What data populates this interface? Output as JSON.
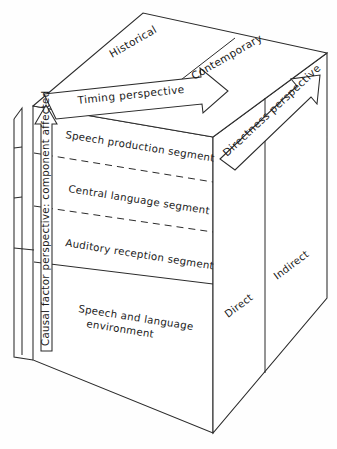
{
  "figure": {
    "background_color": "#fefefe",
    "line_color": "#2b2b2b"
  },
  "top_face": {
    "name": "timing-dimension",
    "segments": [
      {
        "label": "Historical"
      },
      {
        "label": "Contemporary"
      }
    ]
  },
  "front_face": {
    "name": "component-dimension",
    "segments": [
      {
        "label": "Speech production segment",
        "divider": "dashed"
      },
      {
        "label": "Central language segment",
        "divider": "dashed"
      },
      {
        "label": "Auditory reception segment",
        "divider": "solid"
      },
      {
        "label_line1": "Speech and language",
        "label_line2": "environment",
        "divider": "none"
      }
    ]
  },
  "side_face": {
    "name": "directness-dimension",
    "segments": [
      {
        "label": "Direct"
      },
      {
        "label": "Indirect"
      }
    ]
  },
  "arrows": {
    "timing": {
      "label": "Timing perspective"
    },
    "directness": {
      "label": "Directness perspective"
    },
    "causal": {
      "label": "Causal factor perspective: component affected"
    }
  }
}
